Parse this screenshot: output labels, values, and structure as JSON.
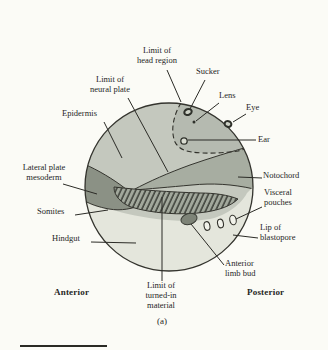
{
  "figure": {
    "panel_label": "(a)",
    "labels": {
      "head_limit": "Limit of\nhead region",
      "sucker": "Sucker",
      "neural_limit": "Limit of\nneural plate",
      "lens": "Lens",
      "eye": "Eye",
      "epidermis": "Epidermis",
      "ear": "Ear",
      "lateral_plate": "Lateral plate\nmesoderm",
      "notochord": "Notochord",
      "visceral_pouches": "Visceral\npouches",
      "somites": "Somites",
      "hindgut": "Hindgut",
      "lip_of_blastopore": "Lip of\nblastopore",
      "anterior_limb_bud": "Anterior\nlimb bud",
      "turned_in_limit": "Limit of\nturned-in\nmaterial",
      "anterior": "Anterior",
      "posterior": "Posterior"
    },
    "regions": [
      {
        "name": "epidermis",
        "color": "#c4c8be"
      },
      {
        "name": "head-region",
        "color": "#b5bab0"
      },
      {
        "name": "notochord",
        "color": "#a7ada1"
      },
      {
        "name": "somites",
        "color": "#a2a89c",
        "pattern": "diagonal-hatch"
      },
      {
        "name": "lateral-plate-mesoderm",
        "color": "#8b9185"
      },
      {
        "name": "hindgut",
        "color": "#e4e6dc"
      },
      {
        "name": "anterior-limb-bud",
        "color": "#7d8377"
      },
      {
        "name": "visceral-pouch",
        "color": "#f1f2ea"
      }
    ],
    "line_colors": {
      "outline": "#34342e",
      "pointer": "#2b2b26",
      "dashed_boundary": "#2f2f29"
    },
    "background": "#fbfbf6"
  }
}
